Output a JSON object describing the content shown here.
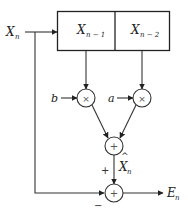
{
  "diagram": {
    "type": "signal-flow / DPCM predictor block diagram",
    "input": {
      "label": "X",
      "subscript": "n"
    },
    "delay_register": {
      "cells": [
        {
          "label": "X",
          "subscript": "n − 1"
        },
        {
          "label": "X",
          "subscript": "n − 2"
        }
      ]
    },
    "multipliers": [
      {
        "coefficient": "b",
        "symbol": "×",
        "input_from": "X_{n-1}"
      },
      {
        "coefficient": "a",
        "symbol": "×",
        "input_from": "X_{n-2}"
      }
    ],
    "predictor_adder": {
      "symbol": "+",
      "output": {
        "label": "X",
        "hat": "^",
        "subscript": "n"
      }
    },
    "error_adder": {
      "symbol": "+",
      "signs": {
        "top": "+",
        "left": "−"
      },
      "output": {
        "label": "E",
        "subscript": "n"
      }
    }
  }
}
